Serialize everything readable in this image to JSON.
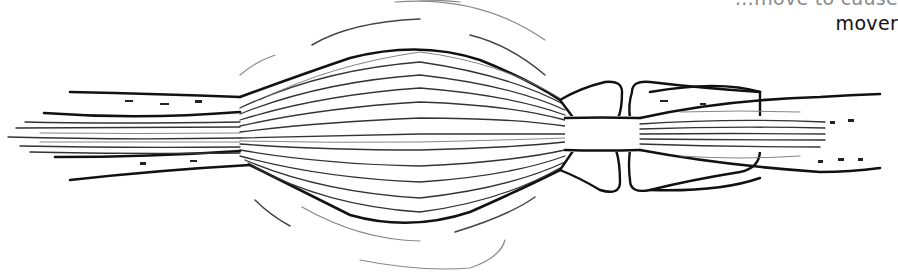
{
  "figure": {
    "caption_fragment_top": "…move to cause",
    "caption_fragment_bottom": "mover",
    "colors": {
      "ink": "#111111",
      "background": "#ffffff"
    }
  }
}
